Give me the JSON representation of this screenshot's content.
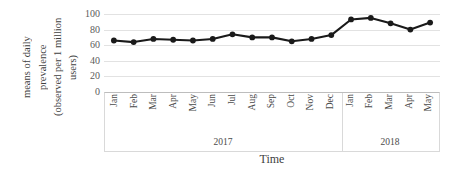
{
  "chart_data": {
    "type": "line",
    "title": "",
    "xlabel": "Time",
    "ylabel": "means of daily prevalence (observed per 1 million users)",
    "ylim": [
      0,
      100
    ],
    "ytick_step": 20,
    "grid": true,
    "legend": "none",
    "categories": [
      "Jan",
      "Feb",
      "Mar",
      "Apr",
      "May",
      "Jun",
      "Jul",
      "Aug",
      "Sep",
      "Oct",
      "Nov",
      "Dec",
      "Jan",
      "Feb",
      "Mar",
      "Apr",
      "May"
    ],
    "values": [
      66,
      64,
      68,
      67,
      66,
      68,
      74,
      70,
      70,
      65,
      68,
      73,
      93,
      95,
      88,
      80,
      89
    ],
    "yticks": [
      "100",
      "80",
      "60",
      "40",
      "20",
      "0"
    ],
    "year_groups": [
      {
        "label": "2017",
        "count": 12
      },
      {
        "label": "2018",
        "count": 5
      }
    ],
    "series": [
      {
        "name": "means of daily prevalence",
        "values": [
          66,
          64,
          68,
          67,
          66,
          68,
          74,
          70,
          70,
          65,
          68,
          73,
          93,
          95,
          88,
          80,
          89
        ],
        "color": "#1a1a1a",
        "marker": "circle"
      }
    ]
  },
  "axes": {
    "y_title_lines": [
      "means of daily",
      "prevalence",
      "(observed per 1 million",
      "users)"
    ],
    "x_title": "Time"
  },
  "colors": {
    "line": "#1a1a1a",
    "marker": "#1a1a1a",
    "gridline": "#e2e2e2",
    "border": "#d9d9d9",
    "text": "#3f3f3f",
    "background": "#ffffff"
  }
}
